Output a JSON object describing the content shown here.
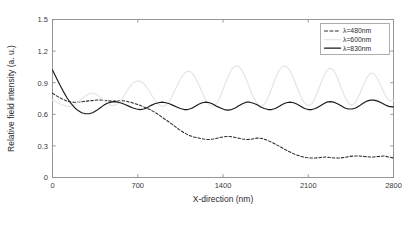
{
  "chart_data": {
    "type": "line",
    "title": "",
    "xlabel": "X-direction (nm)",
    "ylabel": "Relative field intensity (a. u.)",
    "xlim": [
      0,
      2800
    ],
    "ylim": [
      0,
      1.5
    ],
    "xticks": [
      0,
      700,
      1400,
      2100,
      2800
    ],
    "xtick_labels": [
      "0",
      "700",
      "1400",
      "2100",
      "2800"
    ],
    "yticks": [
      0,
      0.3,
      0.6,
      0.9,
      1.2,
      1.5
    ],
    "ytick_labels": [
      "0",
      "0.3",
      "0.6",
      "0.9",
      "1.2",
      "1.5"
    ],
    "grid": false,
    "legend_position": "top-right",
    "series": [
      {
        "name": "lambda-480nm",
        "label": "λ=480nm",
        "style": "dashed",
        "color": "#2b2b2b",
        "x": [
          0,
          40,
          80,
          120,
          160,
          200,
          240,
          280,
          320,
          360,
          400,
          440,
          480,
          520,
          560,
          600,
          640,
          680,
          720,
          760,
          800,
          840,
          880,
          920,
          960,
          1000,
          1040,
          1080,
          1120,
          1160,
          1200,
          1240,
          1280,
          1320,
          1360,
          1400,
          1440,
          1480,
          1520,
          1560,
          1600,
          1640,
          1680,
          1720,
          1760,
          1800,
          1840,
          1880,
          1920,
          1960,
          2000,
          2040,
          2080,
          2120,
          2160,
          2200,
          2240,
          2280,
          2320,
          2360,
          2400,
          2440,
          2480,
          2520,
          2560,
          2600,
          2640,
          2680,
          2720,
          2760,
          2800
        ],
        "y": [
          0.8,
          0.77,
          0.745,
          0.725,
          0.715,
          0.715,
          0.72,
          0.725,
          0.73,
          0.735,
          0.735,
          0.73,
          0.725,
          0.725,
          0.73,
          0.725,
          0.715,
          0.7,
          0.685,
          0.665,
          0.645,
          0.62,
          0.59,
          0.555,
          0.525,
          0.49,
          0.455,
          0.425,
          0.4,
          0.385,
          0.375,
          0.365,
          0.36,
          0.365,
          0.375,
          0.385,
          0.39,
          0.385,
          0.375,
          0.365,
          0.36,
          0.365,
          0.375,
          0.37,
          0.355,
          0.335,
          0.31,
          0.285,
          0.26,
          0.235,
          0.215,
          0.2,
          0.19,
          0.185,
          0.185,
          0.19,
          0.195,
          0.19,
          0.185,
          0.185,
          0.19,
          0.2,
          0.205,
          0.205,
          0.2,
          0.195,
          0.195,
          0.2,
          0.205,
          0.195,
          0.185
        ]
      },
      {
        "name": "lambda-600nm",
        "label": "λ=600nm",
        "style": "solid",
        "color": "#e6e6e6",
        "x": [
          0,
          30,
          60,
          90,
          120,
          150,
          180,
          210,
          240,
          270,
          300,
          330,
          360,
          390,
          420,
          450,
          480,
          510,
          540,
          570,
          600,
          630,
          660,
          690,
          720,
          750,
          780,
          810,
          840,
          870,
          900,
          930,
          960,
          990,
          1020,
          1050,
          1080,
          1110,
          1140,
          1170,
          1200,
          1230,
          1260,
          1290,
          1320,
          1350,
          1380,
          1410,
          1440,
          1470,
          1500,
          1530,
          1560,
          1590,
          1620,
          1650,
          1680,
          1710,
          1740,
          1770,
          1800,
          1830,
          1860,
          1890,
          1920,
          1950,
          1980,
          2010,
          2040,
          2070,
          2100,
          2130,
          2160,
          2190,
          2220,
          2250,
          2280,
          2310,
          2340,
          2370,
          2400,
          2430,
          2460,
          2490,
          2520,
          2550,
          2580,
          2610,
          2640,
          2670,
          2700,
          2730,
          2760,
          2790,
          2800
        ],
        "y": [
          0.735,
          0.72,
          0.7,
          0.685,
          0.675,
          0.675,
          0.69,
          0.715,
          0.745,
          0.775,
          0.795,
          0.8,
          0.79,
          0.765,
          0.735,
          0.705,
          0.685,
          0.685,
          0.705,
          0.745,
          0.8,
          0.855,
          0.895,
          0.915,
          0.915,
          0.89,
          0.845,
          0.79,
          0.735,
          0.695,
          0.675,
          0.685,
          0.725,
          0.79,
          0.865,
          0.935,
          0.985,
          1.01,
          1.0,
          0.955,
          0.885,
          0.805,
          0.73,
          0.685,
          0.675,
          0.705,
          0.775,
          0.865,
          0.955,
          1.025,
          1.06,
          1.055,
          1.01,
          0.935,
          0.845,
          0.76,
          0.7,
          0.675,
          0.695,
          0.755,
          0.845,
          0.94,
          1.015,
          1.055,
          1.055,
          1.015,
          0.94,
          0.85,
          0.765,
          0.705,
          0.68,
          0.7,
          0.765,
          0.855,
          0.945,
          1.015,
          1.04,
          1.015,
          0.945,
          0.855,
          0.765,
          0.705,
          0.685,
          0.715,
          0.785,
          0.87,
          0.945,
          0.99,
          0.985,
          0.935,
          0.86,
          0.785,
          0.735,
          0.725,
          0.73
        ]
      },
      {
        "name": "lambda-830nm",
        "label": "λ=830nm",
        "style": "solid",
        "color": "#1a1a1a",
        "x": [
          0,
          30,
          60,
          90,
          120,
          150,
          180,
          210,
          240,
          270,
          300,
          330,
          360,
          390,
          420,
          450,
          480,
          510,
          540,
          570,
          600,
          630,
          660,
          690,
          720,
          750,
          780,
          810,
          840,
          870,
          900,
          930,
          960,
          990,
          1020,
          1050,
          1080,
          1110,
          1140,
          1170,
          1200,
          1230,
          1260,
          1290,
          1320,
          1350,
          1380,
          1410,
          1440,
          1470,
          1500,
          1530,
          1560,
          1590,
          1620,
          1650,
          1680,
          1710,
          1740,
          1770,
          1800,
          1830,
          1860,
          1890,
          1920,
          1950,
          1980,
          2010,
          2040,
          2070,
          2100,
          2130,
          2160,
          2190,
          2220,
          2250,
          2280,
          2310,
          2340,
          2370,
          2400,
          2430,
          2460,
          2490,
          2520,
          2550,
          2580,
          2610,
          2640,
          2670,
          2700,
          2730,
          2760,
          2790,
          2800
        ],
        "y": [
          1.02,
          0.95,
          0.88,
          0.815,
          0.755,
          0.705,
          0.665,
          0.635,
          0.615,
          0.605,
          0.605,
          0.615,
          0.635,
          0.66,
          0.685,
          0.705,
          0.715,
          0.72,
          0.715,
          0.705,
          0.69,
          0.675,
          0.66,
          0.65,
          0.645,
          0.65,
          0.665,
          0.685,
          0.7,
          0.71,
          0.715,
          0.71,
          0.7,
          0.685,
          0.67,
          0.655,
          0.645,
          0.645,
          0.655,
          0.675,
          0.695,
          0.71,
          0.715,
          0.71,
          0.695,
          0.675,
          0.66,
          0.645,
          0.64,
          0.645,
          0.66,
          0.68,
          0.7,
          0.715,
          0.715,
          0.705,
          0.69,
          0.67,
          0.655,
          0.645,
          0.645,
          0.655,
          0.675,
          0.695,
          0.71,
          0.715,
          0.71,
          0.695,
          0.675,
          0.655,
          0.645,
          0.645,
          0.655,
          0.675,
          0.695,
          0.715,
          0.72,
          0.715,
          0.7,
          0.68,
          0.66,
          0.65,
          0.65,
          0.66,
          0.68,
          0.705,
          0.725,
          0.735,
          0.735,
          0.725,
          0.71,
          0.69,
          0.675,
          0.67,
          0.67
        ]
      }
    ]
  }
}
